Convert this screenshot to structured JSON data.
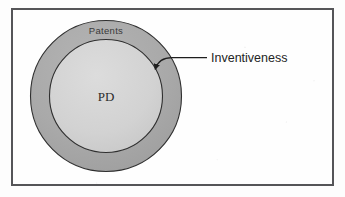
{
  "figure": {
    "title": "",
    "background_color": "#fdfdfd",
    "frame": {
      "name": "figure-border",
      "color": "#555558"
    }
  },
  "diagram": {
    "type": "concentric-circles",
    "outer_region": {
      "label": "Patents",
      "fill_color": "#a9a9a9",
      "stroke_color": "#2f2f2f",
      "description": "outer annulus ring"
    },
    "inner_region": {
      "label": "PD",
      "fill_color": "#d2d2d2",
      "stroke_color": "#2f2f2f",
      "description": "inner filled circle"
    },
    "annotations": [
      {
        "label": "Inventiveness",
        "target": "outer_region",
        "leader": "curved-arrow",
        "color": "#242424"
      }
    ]
  },
  "geometry": {
    "center_x": 106,
    "center_y": 96,
    "outer_radius": 76,
    "inner_radius": 57
  }
}
